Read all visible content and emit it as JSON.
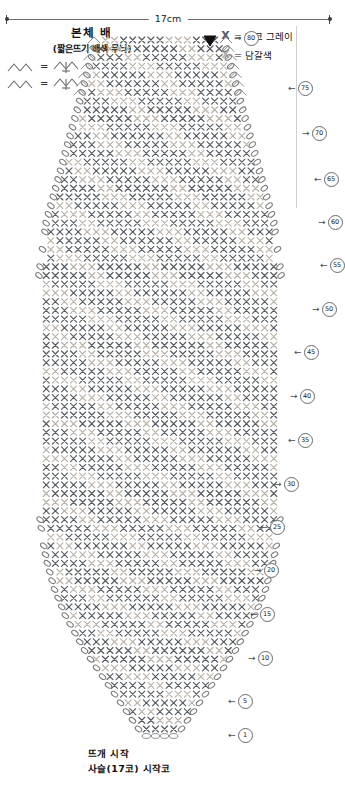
{
  "dimension": {
    "label": "17cm"
  },
  "title": {
    "main": "본체 배",
    "sub": "(짧은뜨기 배색 무늬)"
  },
  "symbol_legend": [
    {
      "left": "decrease-2tog-symbol",
      "eq": "=",
      "right": "sc2tog-symbol"
    },
    {
      "left": "decrease-2tog-symbol",
      "eq": "=",
      "right": "sc2tog-symbol"
    }
  ],
  "color_legend": [
    {
      "symbol": "X",
      "eq": "=",
      "label": "다크 그레이",
      "color": "#555b60",
      "name": "dark-grey"
    },
    {
      "symbol": "X",
      "eq": "=",
      "label": "담갈색",
      "color": "#b9b2a8",
      "name": "light-brown"
    }
  ],
  "row_markers": [
    {
      "number": "80",
      "direction": "right",
      "x": 232,
      "y": 38
    },
    {
      "number": "75",
      "direction": "left",
      "x": 286,
      "y": 88
    },
    {
      "number": "70",
      "direction": "right",
      "x": 300,
      "y": 133
    },
    {
      "number": "65",
      "direction": "left",
      "x": 312,
      "y": 179
    },
    {
      "number": "60",
      "direction": "right",
      "x": 316,
      "y": 222
    },
    {
      "number": "55",
      "direction": "left",
      "x": 318,
      "y": 265
    },
    {
      "number": "50",
      "direction": "right",
      "x": 310,
      "y": 309
    },
    {
      "number": "45",
      "direction": "left",
      "x": 292,
      "y": 352
    },
    {
      "number": "40",
      "direction": "right",
      "x": 288,
      "y": 396
    },
    {
      "number": "35",
      "direction": "left",
      "x": 286,
      "y": 440
    },
    {
      "number": "30",
      "direction": "right",
      "x": 272,
      "y": 484
    },
    {
      "number": "25",
      "direction": "left",
      "x": 258,
      "y": 527
    },
    {
      "number": "20",
      "direction": "right",
      "x": 252,
      "y": 570
    },
    {
      "number": "15",
      "direction": "left",
      "x": 248,
      "y": 614
    },
    {
      "number": "10",
      "direction": "right",
      "x": 246,
      "y": 658
    },
    {
      "number": "5",
      "direction": "left",
      "x": 226,
      "y": 701
    },
    {
      "number": "1",
      "direction": "left",
      "x": 226,
      "y": 735
    }
  ],
  "bottom_notes": [
    "뜨개 시작",
    "사슬(17코) 시작코"
  ],
  "chart_data": {
    "type": "table",
    "title": "본체 배 (짧은뜨기 배색 무늬)",
    "total_rows": 80,
    "foundation_chain_stitches": 17,
    "width_cm": 17,
    "stitch_symbol": "X",
    "colors": {
      "dark-grey": "#555b60",
      "light-brown": "#b9b2a8"
    },
    "marker_interval": 5,
    "marker_numbers": [
      1,
      5,
      10,
      15,
      20,
      25,
      30,
      35,
      40,
      45,
      50,
      55,
      60,
      65,
      70,
      75,
      80
    ],
    "shape_outline_half_width": [
      0.5,
      0.52,
      0.54,
      0.56,
      0.58,
      0.6,
      0.62,
      0.64,
      0.66,
      0.68,
      0.7,
      0.72,
      0.74,
      0.76,
      0.78,
      0.8,
      0.82,
      0.84,
      0.86,
      0.88,
      0.9,
      0.92,
      0.93,
      0.94,
      0.95,
      0.96,
      0.97,
      0.98,
      0.985,
      0.99,
      0.995,
      1.0,
      1.0,
      1.0,
      1.0,
      1.0,
      1.0,
      1.0,
      1.0,
      1.0,
      1.0,
      1.0,
      1.0,
      1.0,
      1.0,
      1.0,
      1.0,
      1.0,
      1.0,
      1.0,
      1.0,
      0.995,
      0.99,
      0.985,
      0.98,
      0.97,
      0.96,
      0.95,
      0.94,
      0.925,
      0.91,
      0.89,
      0.87,
      0.85,
      0.82,
      0.79,
      0.76,
      0.72,
      0.68,
      0.64,
      0.6,
      0.55,
      0.5,
      0.45,
      0.4,
      0.35,
      0.3,
      0.25,
      0.2,
      0.15
    ]
  }
}
